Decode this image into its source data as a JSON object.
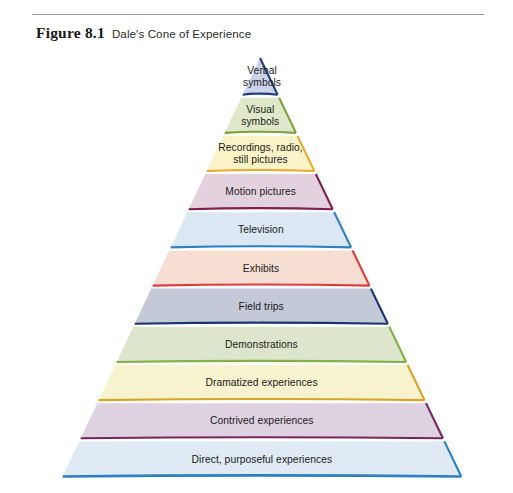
{
  "figure": {
    "label": "Figure 8.1",
    "title": "Dale's Cone of Experience"
  },
  "chart_data": {
    "type": "pie",
    "title": "Dale's Cone of Experience",
    "subtitle": "",
    "xlabel": "",
    "ylabel": "",
    "orientation": "pyramid-descending",
    "note": "Eleven stacked bands of a triangular cone; top band is the apex triangle. Ordered apex (most abstract) to base (most concrete).",
    "categories": [
      "Verbal symbols",
      "Visual symbols",
      "Recordings, radio, still pictures",
      "Motion pictures",
      "Television",
      "Exhibits",
      "Field trips",
      "Demonstrations",
      "Dramatized experiences",
      "Contrived experiences",
      "Direct, purposeful experiences"
    ],
    "values": [
      1,
      2,
      3,
      4,
      5,
      6,
      7,
      8,
      9,
      10,
      11
    ],
    "legend_position": "none",
    "grid": false
  },
  "cone": {
    "levels": [
      {
        "id": "verbal-symbols",
        "lines": [
          "Verbal",
          "symbols"
        ],
        "fill": "#ccd3e8",
        "accent": "#1f3f7a",
        "edge": "#1f3f7a"
      },
      {
        "id": "visual-symbols",
        "lines": [
          "Visual",
          "symbols"
        ],
        "fill": "#dfe8c8",
        "accent": "#7ba33c",
        "edge": "#7ba33c"
      },
      {
        "id": "recordings-radio-still-pictures",
        "lines": [
          "Recordings, radio,",
          "still pictures"
        ],
        "fill": "#faf3c8",
        "accent": "#e8a92c",
        "edge": "#e8a92c"
      },
      {
        "id": "motion-pictures",
        "lines": [
          "Motion pictures"
        ],
        "fill": "#e3d2dd",
        "accent": "#7e1f4e",
        "edge": "#7e1f4e"
      },
      {
        "id": "television",
        "lines": [
          "Television"
        ],
        "fill": "#dbe7f2",
        "accent": "#2b7fc4",
        "edge": "#2b7fc4"
      },
      {
        "id": "exhibits",
        "lines": [
          "Exhibits"
        ],
        "fill": "#f6ded2",
        "accent": "#e03b3b",
        "edge": "#e03b3b"
      },
      {
        "id": "field-trips",
        "lines": [
          "Field trips"
        ],
        "fill": "#c3c9d6",
        "accent": "#17356e",
        "edge": "#17356e"
      },
      {
        "id": "demonstrations",
        "lines": [
          "Demonstrations"
        ],
        "fill": "#dde5cd",
        "accent": "#7cb342",
        "edge": "#7cb342"
      },
      {
        "id": "dramatized-experiences",
        "lines": [
          "Dramatized experiences"
        ],
        "fill": "#f7f3cf",
        "accent": "#d9a326",
        "edge": "#d9a326"
      },
      {
        "id": "contrived-experiences",
        "lines": [
          "Contrived experiences"
        ],
        "fill": "#ded2e0",
        "accent": "#76265c",
        "edge": "#76265c"
      },
      {
        "id": "direct-purposeful-experiences",
        "lines": [
          "Direct, purposeful experiences"
        ],
        "fill": "#dfeaf4",
        "accent": "#2b7fc4",
        "edge": "#2b7fc4"
      }
    ]
  }
}
